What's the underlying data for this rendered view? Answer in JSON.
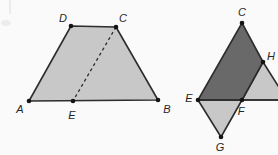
{
  "colors": {
    "background": "#fafafa",
    "shape_fill_light": "#c8c8c8",
    "shape_fill_dark": "#696969",
    "line": "#2d2d2d",
    "dot": "#141414",
    "label_text": "#262626",
    "scan_artifact": "#ececec"
  },
  "figures": [
    {
      "name": "trapezoid-ABCD-with-dashed-CE",
      "points": {
        "A": [
          29,
          101
        ],
        "B": [
          158,
          100
        ],
        "C": [
          116,
          27
        ],
        "D": [
          71,
          26
        ],
        "E": [
          73,
          101
        ]
      },
      "polygons": [
        {
          "name": "trapezoid-ADCB",
          "vertices": [
            "A",
            "D",
            "C",
            "B"
          ],
          "fill": "light"
        }
      ],
      "dashed_segments": [
        {
          "name": "dashed-segment-CE",
          "from": "C",
          "to": "E"
        }
      ],
      "segments": [],
      "dots": [
        "A",
        "B",
        "C",
        "D",
        "E"
      ],
      "labels": [
        {
          "text": "A",
          "x": 20,
          "y": 109
        },
        {
          "text": "B",
          "x": 167,
          "y": 109
        },
        {
          "text": "C",
          "x": 123,
          "y": 18
        },
        {
          "text": "D",
          "x": 63,
          "y": 18
        },
        {
          "text": "E",
          "x": 72,
          "y": 115
        }
      ]
    },
    {
      "name": "parallelogram-CEGH-with-baseline-through-F",
      "points": {
        "C": [
          242,
          23
        ],
        "E": [
          198,
          100
        ],
        "F": [
          242,
          100
        ],
        "G": [
          221,
          137
        ],
        "H": [
          263,
          62
        ],
        "X": [
          287,
          100
        ],
        "R": [
          285,
          100
        ]
      },
      "polygons": [
        {
          "name": "triangle-EFG",
          "vertices": [
            "E",
            "F",
            "G"
          ],
          "fill": "light"
        },
        {
          "name": "triangle-HFX",
          "vertices": [
            "H",
            "F",
            "X"
          ],
          "fill": "light"
        },
        {
          "name": "quad-ECHF",
          "vertices": [
            "E",
            "C",
            "H",
            "F"
          ],
          "fill": "dark"
        }
      ],
      "dashed_segments": [],
      "segments": [
        {
          "name": "baseline-E-to-right-edge",
          "from": "E",
          "to": "R"
        }
      ],
      "dots": [
        "C",
        "E",
        "F",
        "G",
        "H"
      ],
      "labels": [
        {
          "text": "C",
          "x": 242,
          "y": 12
        },
        {
          "text": "E",
          "x": 189,
          "y": 98
        },
        {
          "text": "F",
          "x": 241,
          "y": 111
        },
        {
          "text": "G",
          "x": 220,
          "y": 147
        },
        {
          "text": "H",
          "x": 271,
          "y": 56
        }
      ]
    }
  ],
  "artifacts": [
    {
      "name": "scan-mark-vertical",
      "type": "line",
      "x1": 10,
      "y1": 0,
      "x2": 10,
      "y2": 14
    },
    {
      "name": "scan-mark-smudge",
      "type": "ellipse",
      "cx": 6,
      "cy": 23,
      "rx": 5,
      "ry": 3
    }
  ]
}
